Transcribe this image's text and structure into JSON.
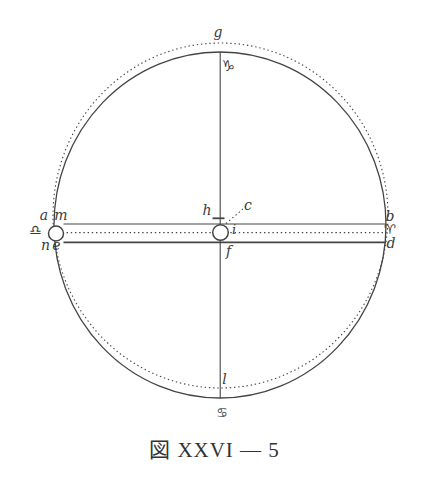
{
  "figure": {
    "caption": "図 XXVI — 5",
    "labels": {
      "g": "g",
      "h": "h",
      "c": "c",
      "i": "i",
      "f": "f",
      "l": "l",
      "a": "a",
      "m": "m",
      "n": "n",
      "e": "e",
      "b": "b",
      "d": "d"
    },
    "symbols": {
      "capricorn": "♑",
      "cancer": "♋",
      "libra": "♎",
      "aries": "♈"
    },
    "colors": {
      "ink": "#444444",
      "text": "#3a3a3a",
      "background": "#ffffff"
    }
  }
}
